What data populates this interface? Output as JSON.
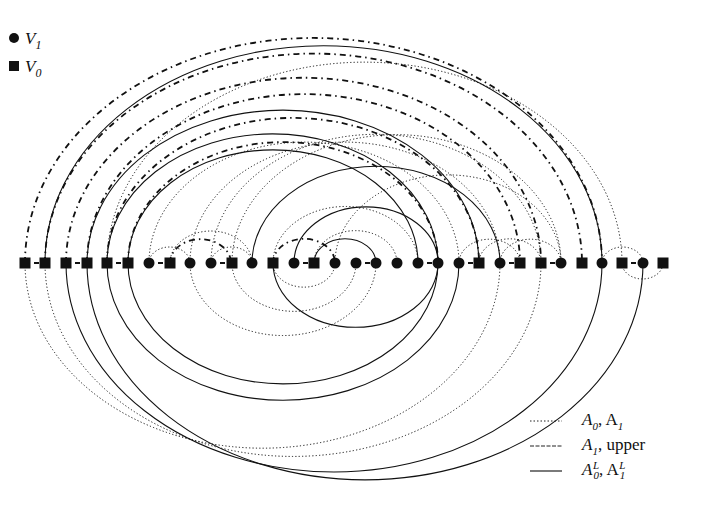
{
  "node_legend": {
    "items": [
      {
        "shape": "circle",
        "label": "V",
        "sub": "1"
      },
      {
        "shape": "square",
        "label": "V",
        "sub": "0"
      }
    ]
  },
  "edge_legend": {
    "items": [
      {
        "style": "dotted",
        "label_parts": [
          "A",
          "0",
          ", A",
          "1"
        ],
        "text": "A0, A1"
      },
      {
        "style": "dashed-thin",
        "label_parts": [
          "A",
          "1",
          ", upper"
        ],
        "text": "A1, upper"
      },
      {
        "style": "solid",
        "label_parts": [
          "A",
          "0",
          "L",
          ", A",
          "1",
          "L"
        ],
        "text": "A0^L, A1^L"
      }
    ]
  },
  "colors": {
    "ink": "#111111",
    "background": "#ffffff"
  },
  "axis_y": 263,
  "nodes": [
    {
      "x": 25,
      "type": "square"
    },
    {
      "x": 45,
      "type": "square"
    },
    {
      "x": 66,
      "type": "square"
    },
    {
      "x": 87,
      "type": "square"
    },
    {
      "x": 107,
      "type": "square"
    },
    {
      "x": 128,
      "type": "square"
    },
    {
      "x": 149,
      "type": "circle"
    },
    {
      "x": 170,
      "type": "square"
    },
    {
      "x": 190,
      "type": "circle"
    },
    {
      "x": 211,
      "type": "circle"
    },
    {
      "x": 232,
      "type": "square"
    },
    {
      "x": 252,
      "type": "circle"
    },
    {
      "x": 273,
      "type": "square"
    },
    {
      "x": 294,
      "type": "circle"
    },
    {
      "x": 314,
      "type": "square"
    },
    {
      "x": 335,
      "type": "circle"
    },
    {
      "x": 356,
      "type": "circle"
    },
    {
      "x": 376,
      "type": "circle"
    },
    {
      "x": 397,
      "type": "circle"
    },
    {
      "x": 418,
      "type": "circle"
    },
    {
      "x": 438,
      "type": "circle"
    },
    {
      "x": 459,
      "type": "circle"
    },
    {
      "x": 479,
      "type": "square"
    },
    {
      "x": 500,
      "type": "circle"
    },
    {
      "x": 520,
      "type": "square"
    },
    {
      "x": 541,
      "type": "square"
    },
    {
      "x": 561,
      "type": "circle"
    },
    {
      "x": 582,
      "type": "square"
    },
    {
      "x": 602,
      "type": "circle"
    },
    {
      "x": 622,
      "type": "square"
    },
    {
      "x": 643,
      "type": "circle"
    },
    {
      "x": 663,
      "type": "square"
    }
  ],
  "edges": {
    "upper_dashed": [
      [
        25,
        602
      ],
      [
        45,
        582
      ],
      [
        66,
        541
      ],
      [
        87,
        520
      ],
      [
        107,
        479
      ],
      [
        128,
        438
      ],
      [
        170,
        231
      ],
      [
        273,
        335
      ]
    ],
    "upper_dotted": [
      [
        149,
        190
      ],
      [
        170,
        252
      ],
      [
        211,
        252
      ],
      [
        273,
        418
      ],
      [
        314,
        397
      ],
      [
        335,
        561
      ],
      [
        107,
        622
      ],
      [
        149,
        459
      ],
      [
        190,
        500
      ],
      [
        211,
        541
      ],
      [
        232,
        561
      ],
      [
        459,
        520
      ],
      [
        500,
        561
      ],
      [
        479,
        541
      ],
      [
        602,
        643
      ]
    ],
    "upper_solid": [
      [
        45,
        602
      ],
      [
        87,
        479
      ],
      [
        107,
        438
      ],
      [
        128,
        418
      ],
      [
        252,
        500
      ],
      [
        294,
        438
      ],
      [
        314,
        376
      ]
    ],
    "lower_dotted": [
      [
        25,
        500
      ],
      [
        45,
        541
      ],
      [
        190,
        376
      ],
      [
        232,
        356
      ],
      [
        273,
        335
      ],
      [
        622,
        663
      ]
    ],
    "lower_solid": [
      [
        66,
        602
      ],
      [
        87,
        643
      ],
      [
        107,
        459
      ],
      [
        128,
        438
      ],
      [
        273,
        438
      ]
    ],
    "axis_short": [
      [
        25,
        45
      ],
      [
        66,
        87
      ],
      [
        107,
        128
      ],
      [
        149,
        170
      ],
      [
        211,
        232
      ],
      [
        294,
        314
      ],
      [
        356,
        376
      ],
      [
        418,
        438
      ],
      [
        459,
        479
      ],
      [
        500,
        520
      ],
      [
        541,
        561
      ],
      [
        622,
        643
      ]
    ]
  }
}
